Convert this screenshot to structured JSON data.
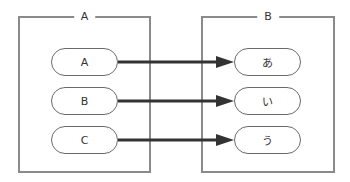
{
  "diagram": {
    "groups": [
      {
        "title": "A",
        "items": [
          "A",
          "B",
          "C"
        ]
      },
      {
        "title": "B",
        "items": [
          "あ",
          "い",
          "う"
        ]
      }
    ],
    "edges": [
      {
        "from": "A",
        "to": "あ"
      },
      {
        "from": "B",
        "to": "い"
      },
      {
        "from": "C",
        "to": "う"
      }
    ],
    "colors": {
      "border": "#8a8a8a",
      "arrow": "#333333",
      "text": "#333333"
    }
  }
}
